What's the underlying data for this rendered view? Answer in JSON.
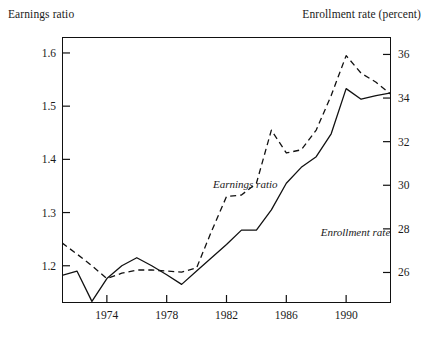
{
  "chart_data": {
    "type": "line",
    "title": "",
    "xlabel": "",
    "ylabel": "Earnings ratio",
    "y2label": "Enrollment rate (percent)",
    "grid": false,
    "legend_position": "inline-annotations",
    "xlim": [
      1971,
      1993
    ],
    "ylim": [
      1.13,
      1.63
    ],
    "y2lim": [
      24.6,
      36.8
    ],
    "xticks": [
      "1974",
      "1978",
      "1982",
      "1986",
      "1990"
    ],
    "xtick_values": [
      1974,
      1978,
      1982,
      1986,
      1990
    ],
    "yticks": [
      "1.2",
      "1.3",
      "1.4",
      "1.5",
      "1.6"
    ],
    "ytick_values": [
      1.2,
      1.3,
      1.4,
      1.5,
      1.6
    ],
    "y2ticks": [
      "26",
      "28",
      "30",
      "32",
      "34",
      "36"
    ],
    "y2tick_values": [
      26,
      28,
      30,
      32,
      34,
      36
    ],
    "x": [
      1971,
      1972,
      1973,
      1974,
      1975,
      1976,
      1977,
      1978,
      1979,
      1980,
      1981,
      1982,
      1983,
      1984,
      1985,
      1986,
      1987,
      1988,
      1989,
      1990,
      1991,
      1992,
      1993
    ],
    "series": [
      {
        "name": "Earnings ratio",
        "axis": "left",
        "style": "dashed",
        "color": "#111111",
        "values": [
          1.243,
          1.222,
          1.2,
          1.176,
          1.186,
          1.192,
          1.192,
          1.19,
          1.188,
          1.196,
          1.265,
          1.33,
          1.333,
          1.355,
          1.455,
          1.412,
          1.418,
          1.455,
          1.52,
          1.595,
          1.562,
          1.545,
          1.522
        ]
      },
      {
        "name": "Enrollment rate",
        "axis": "right",
        "style": "solid",
        "color": "#111111",
        "values": [
          1.182,
          1.19,
          1.133,
          1.176,
          1.2,
          1.215,
          1.2,
          1.183,
          1.165,
          1.19,
          1.215,
          1.24,
          1.267,
          1.267,
          1.305,
          1.355,
          1.385,
          1.405,
          1.448,
          1.533,
          1.513,
          1.52,
          1.525
        ]
      }
    ],
    "annotations": [
      {
        "text": "Earnings ratio",
        "x": 1981.1,
        "y": 1.365
      },
      {
        "text": "Enrollment rate",
        "x": 1988.3,
        "y": 1.275
      }
    ]
  }
}
